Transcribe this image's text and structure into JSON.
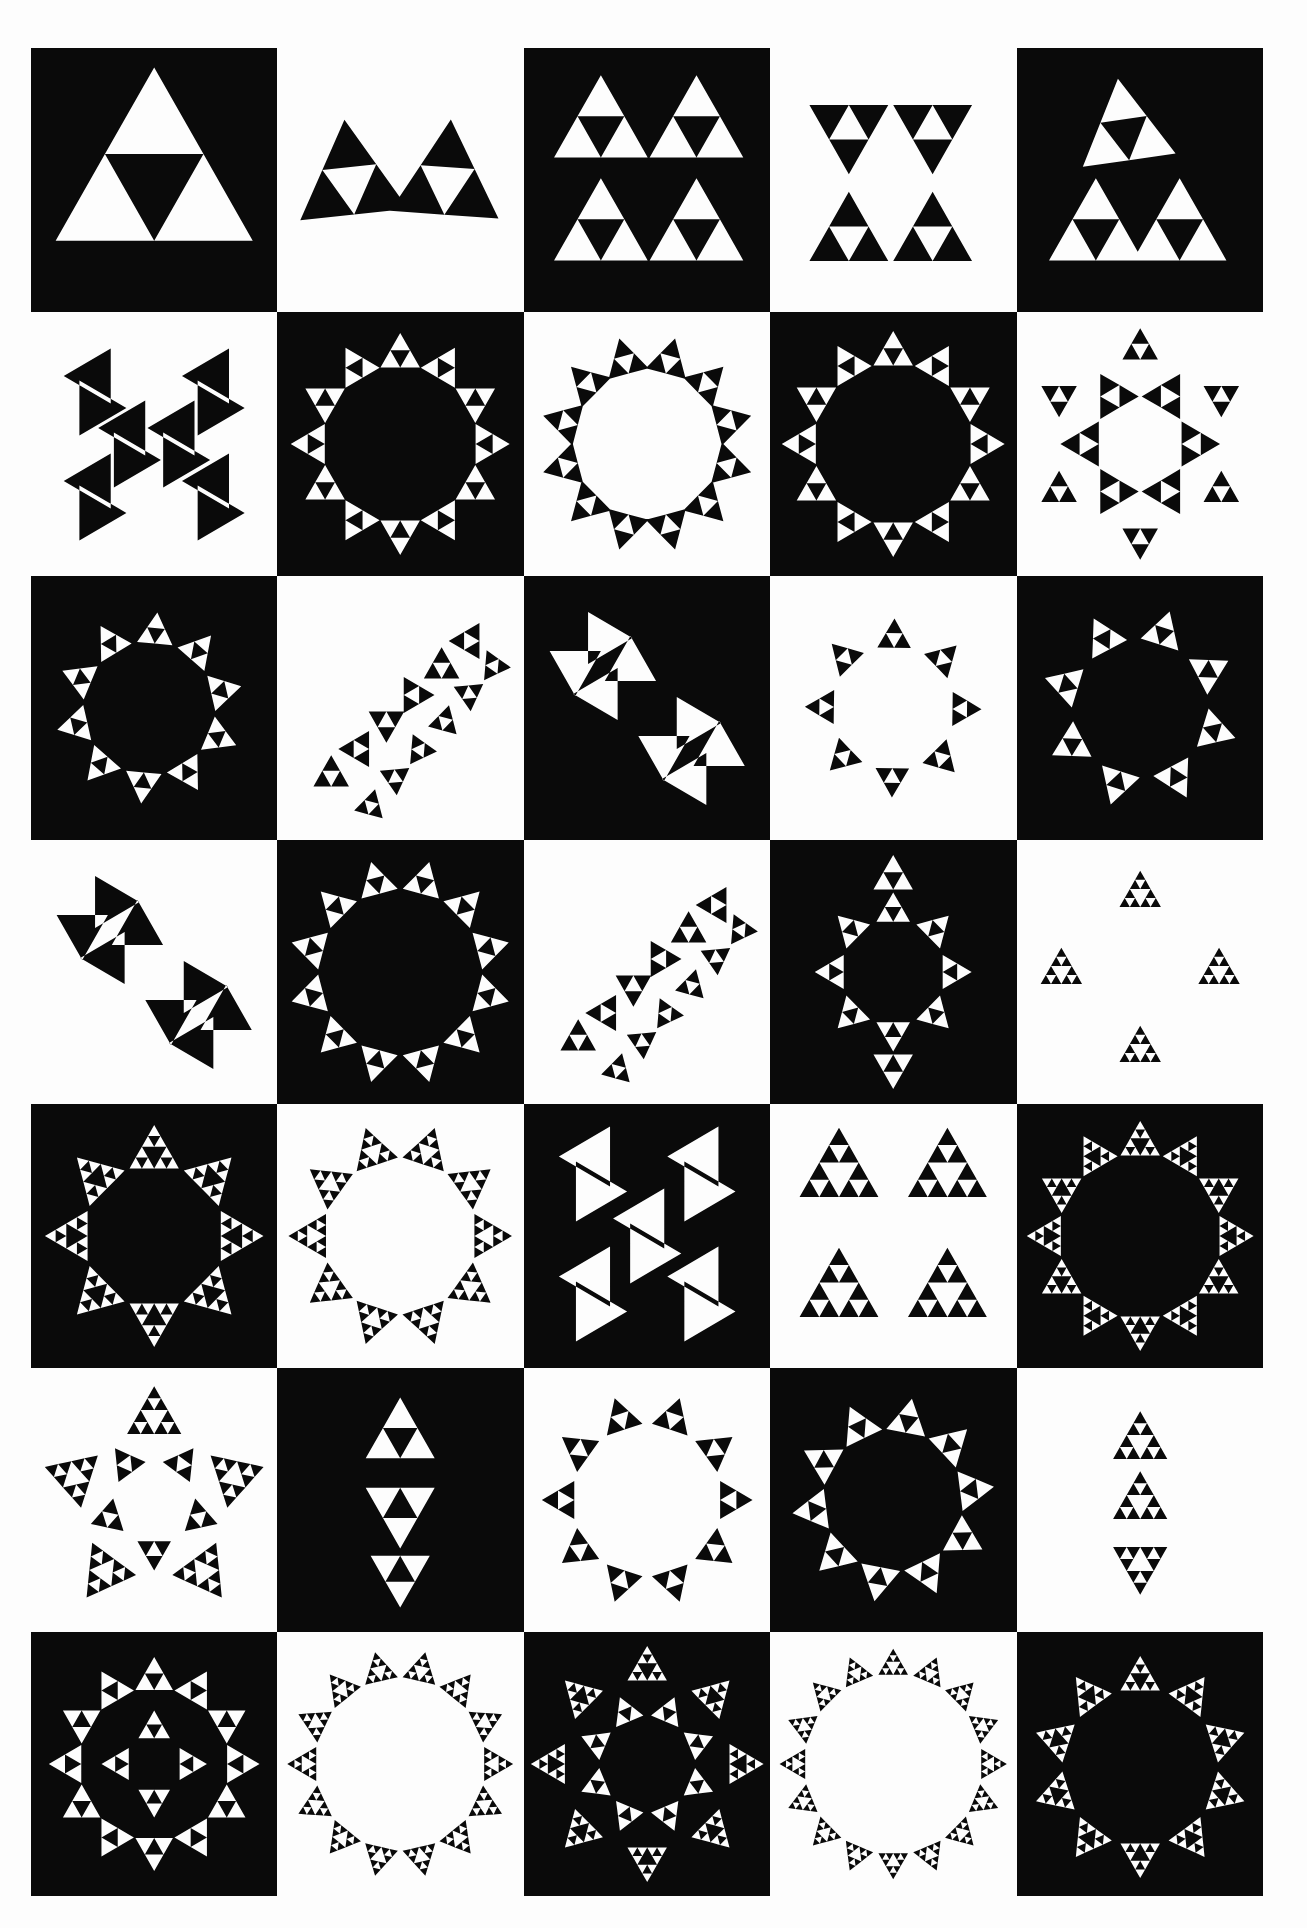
{
  "artwork": {
    "rows": 7,
    "columns": 5,
    "colors": {
      "dark": "#0a0a0a",
      "light": "#fdfdfd"
    },
    "cells": [
      {
        "row": 0,
        "col": 0,
        "motif": "sierpinski-large-triangle"
      },
      {
        "row": 0,
        "col": 1,
        "motif": "twin-triangle-pair"
      },
      {
        "row": 0,
        "col": 2,
        "motif": "four-triangle-cluster"
      },
      {
        "row": 0,
        "col": 3,
        "motif": "hourglass-pair"
      },
      {
        "row": 0,
        "col": 4,
        "motif": "stacked-tall-triangle"
      },
      {
        "row": 1,
        "col": 0,
        "motif": "bowtie-mirror"
      },
      {
        "row": 1,
        "col": 1,
        "motif": "ring-octagon"
      },
      {
        "row": 1,
        "col": 2,
        "motif": "ring-diamond"
      },
      {
        "row": 1,
        "col": 3,
        "motif": "ring-square"
      },
      {
        "row": 1,
        "col": 4,
        "motif": "snowflake-cluster"
      },
      {
        "row": 2,
        "col": 0,
        "motif": "diagonal-ring"
      },
      {
        "row": 2,
        "col": 1,
        "motif": "diagonal-chain"
      },
      {
        "row": 2,
        "col": 2,
        "motif": "pinwheel-pair"
      },
      {
        "row": 2,
        "col": 3,
        "motif": "diagonal-frame"
      },
      {
        "row": 2,
        "col": 4,
        "motif": "diagonal-blocks"
      },
      {
        "row": 3,
        "col": 0,
        "motif": "pinwheel-pair"
      },
      {
        "row": 3,
        "col": 1,
        "motif": "square-frame"
      },
      {
        "row": 3,
        "col": 2,
        "motif": "diagonal-chain"
      },
      {
        "row": 3,
        "col": 3,
        "motif": "leaf-cross"
      },
      {
        "row": 3,
        "col": 4,
        "motif": "fine-cross"
      },
      {
        "row": 4,
        "col": 0,
        "motif": "rosette-ring"
      },
      {
        "row": 4,
        "col": 1,
        "motif": "dotted-wreath"
      },
      {
        "row": 4,
        "col": 2,
        "motif": "bowtie-columns"
      },
      {
        "row": 4,
        "col": 3,
        "motif": "lattice-block"
      },
      {
        "row": 4,
        "col": 4,
        "motif": "dense-ring"
      },
      {
        "row": 5,
        "col": 0,
        "motif": "five-point-star"
      },
      {
        "row": 5,
        "col": 1,
        "motif": "spindle"
      },
      {
        "row": 5,
        "col": 2,
        "motif": "vase-outline"
      },
      {
        "row": 5,
        "col": 3,
        "motif": "skewed-ring"
      },
      {
        "row": 5,
        "col": 4,
        "motif": "spindle-small"
      },
      {
        "row": 6,
        "col": 0,
        "motif": "oval-rosette"
      },
      {
        "row": 6,
        "col": 1,
        "motif": "spiked-ring"
      },
      {
        "row": 6,
        "col": 2,
        "motif": "star-burst"
      },
      {
        "row": 6,
        "col": 3,
        "motif": "spiked-rectangle"
      },
      {
        "row": 6,
        "col": 4,
        "motif": "pentagon-frame"
      }
    ]
  }
}
